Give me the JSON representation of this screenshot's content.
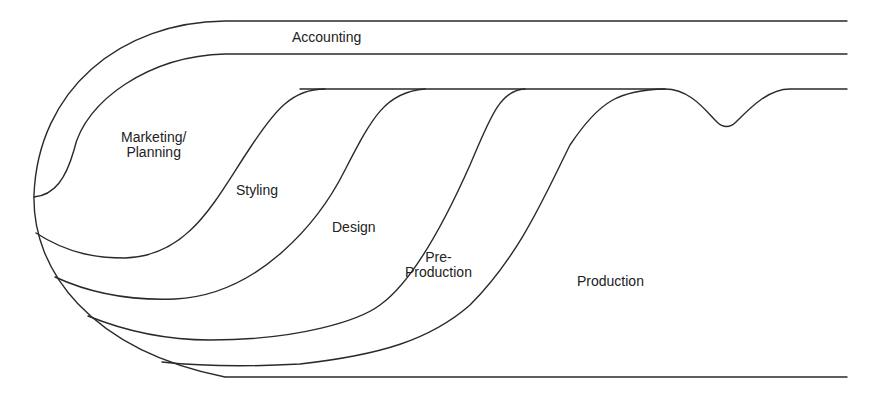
{
  "diagram": {
    "type": "process-flow-overlap",
    "stroke_color": "#2a2a2a",
    "background": "#ffffff",
    "regions": [
      {
        "id": "accounting",
        "label_lines": [
          "Accounting"
        ]
      },
      {
        "id": "marketing-planning",
        "label_lines": [
          "Marketing/",
          "Planning"
        ]
      },
      {
        "id": "styling",
        "label_lines": [
          "Styling"
        ]
      },
      {
        "id": "design",
        "label_lines": [
          "Design"
        ]
      },
      {
        "id": "pre-production",
        "label_lines": [
          "Pre-",
          "Production"
        ]
      },
      {
        "id": "production",
        "label_lines": [
          "Production"
        ]
      }
    ]
  }
}
